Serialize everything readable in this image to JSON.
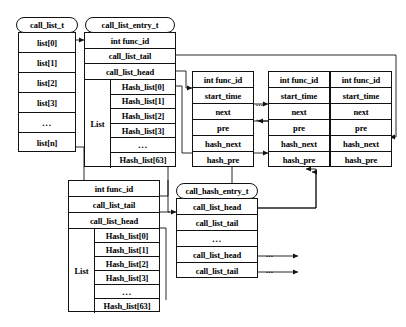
{
  "diagram": {
    "stroke_color": "#111111",
    "background_color": "#ffffff"
  },
  "structs": {
    "call_list_t": {
      "name": "call_list_t",
      "rows": [
        "list[0]",
        "list[1]",
        "list[2]",
        "list[3]",
        "...",
        "list[n]"
      ]
    },
    "call_list_entry_top": {
      "name": "call_list_entry_t",
      "rows": [
        "int func_id",
        "call_list_tail",
        "call_list_head"
      ],
      "list_label": "List",
      "list_rows": [
        "Hash_list[0]",
        "Hash_list[1]",
        "Hash_list[2]",
        "Hash_list[3]",
        "...",
        "Hash_list[63]"
      ]
    },
    "call_list_entry_bottom": {
      "name": "call_list_entry_t",
      "rows": [
        "int func_id",
        "call_list_tail",
        "call_list_head"
      ],
      "list_label": "List",
      "list_rows": [
        "Hash_list[0]",
        "Hash_list[1]",
        "Hash_list[2]",
        "Hash_list[3]",
        "...",
        "Hash_list[63]"
      ]
    },
    "call_hash_entry_t": {
      "name": "call_hash_entry_t",
      "rows": [
        "call_list_head",
        "call_list_tail",
        "...",
        "call_list_head",
        "call_list_tail"
      ]
    },
    "node1": {
      "rows": [
        "int func_id",
        "start_time",
        "next",
        "pre",
        "hash_next",
        "hash_pre"
      ]
    },
    "node2": {
      "rows": [
        "int func_id",
        "start_time",
        "next",
        "pre",
        "hash_next",
        "hash_pre"
      ]
    },
    "node3": {
      "rows": [
        "int func_id",
        "start_time",
        "next",
        "pre",
        "hash_next",
        "hash_pre"
      ]
    }
  },
  "ellipses": {
    "between_nodes_next": "...",
    "between_nodes_pre": "...",
    "hash_head_tail_1": "...",
    "hash_head_tail_2": "..."
  }
}
